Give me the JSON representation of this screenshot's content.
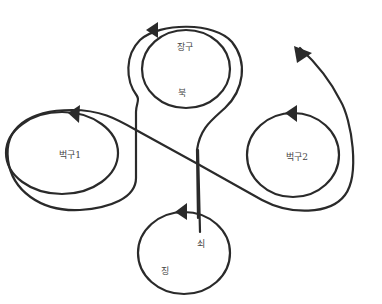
{
  "diagram": {
    "type": "movement-formation",
    "stroke_color": "#2a2a2a",
    "labels": {
      "janggu": "장구",
      "buk": "북",
      "beokgu1": "벅구1",
      "beokgu2": "벅구2",
      "soe": "쇠",
      "jing": "징"
    },
    "nodes": [
      {
        "id": "top-loop",
        "labels": [
          "장구",
          "북"
        ]
      },
      {
        "id": "left-loop",
        "labels": [
          "벅구1"
        ]
      },
      {
        "id": "right-loop",
        "labels": [
          "벅구2"
        ]
      },
      {
        "id": "bottom-loop",
        "labels": [
          "쇠",
          "징"
        ]
      }
    ],
    "edges": [
      {
        "from": "left-loop",
        "to": "right-loop",
        "note": "path runs from left loop across to wrap right loop, ending in arrow pointing upper-left"
      },
      {
        "from": "bottom-loop",
        "to": "top-loop",
        "note": "vertical paths connect bottom loop up into the top double loop"
      }
    ]
  }
}
